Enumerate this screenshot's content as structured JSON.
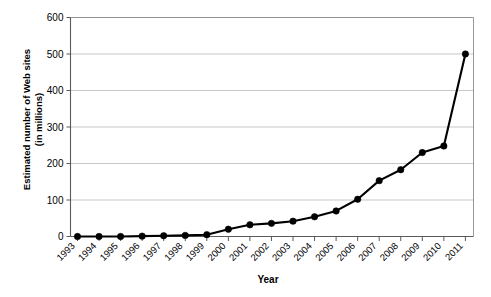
{
  "chart_data": {
    "type": "line",
    "title": "",
    "xlabel": "Year",
    "ylabel": "Estimated number of Web sites\n(in millions)",
    "categories": [
      "1993",
      "1994",
      "1995",
      "1996",
      "1997",
      "1998",
      "1999",
      "2000",
      "2001",
      "2002",
      "2003",
      "2004",
      "2005",
      "2006",
      "2007",
      "2008",
      "2009",
      "2010",
      "2011"
    ],
    "values": [
      0,
      0,
      0,
      1,
      2,
      3,
      5,
      20,
      32,
      36,
      42,
      54,
      70,
      102,
      153,
      183,
      230,
      248,
      500
    ],
    "ylim": [
      0,
      600
    ],
    "yticks": [
      0,
      100,
      200,
      300,
      400,
      500,
      600
    ],
    "ytick_labels": [
      "0",
      "100",
      "200",
      "300",
      "400",
      "500",
      "600"
    ],
    "xtick_labels": [
      "1993",
      "1994",
      "1995",
      "1996",
      "1997",
      "1998",
      "1999",
      "2000",
      "2001",
      "2002",
      "2003",
      "2004",
      "2005",
      "2006",
      "2007",
      "2008",
      "2009",
      "2010",
      "2011"
    ],
    "grid": true,
    "grid_axis": "y",
    "legend": false,
    "legend_position": "none",
    "series_color": "#000000",
    "grid_color": "#b9b9b9",
    "marker": "circle",
    "xtick_rotation": -45
  },
  "labels": {
    "y_axis_title_line1": "Estimated number of Web sites",
    "y_axis_title_line2": "(in millions)",
    "x_axis_title": "Year"
  }
}
